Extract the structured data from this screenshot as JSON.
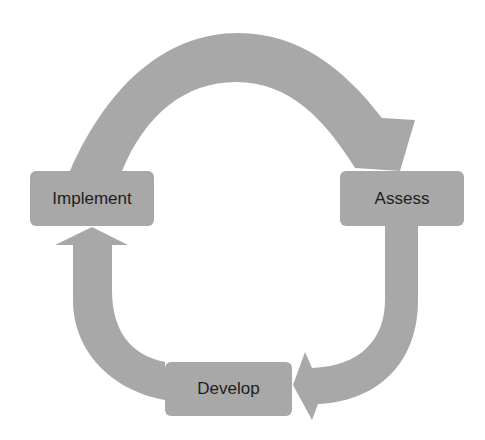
{
  "diagram": {
    "type": "cycle",
    "colors": {
      "shape_fill": "#a8a8a8",
      "text": "#1e1e1e",
      "background": "#ffffff"
    },
    "nodes": [
      {
        "id": "implement",
        "label": "Implement"
      },
      {
        "id": "assess",
        "label": "Assess"
      },
      {
        "id": "develop",
        "label": "Develop"
      }
    ],
    "edges": [
      {
        "from": "implement",
        "to": "assess",
        "shape": "curved-arrow-over-top"
      },
      {
        "from": "assess",
        "to": "develop",
        "shape": "curved-arrow-down-left"
      },
      {
        "from": "develop",
        "to": "implement",
        "shape": "curved-arrow-up-left"
      }
    ]
  }
}
